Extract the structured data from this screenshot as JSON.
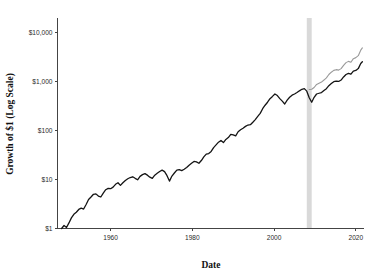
{
  "chart_data": {
    "type": "line",
    "title": "",
    "subtitle": "",
    "xlabel": "Date",
    "ylabel": "Growth of $1 (Log Scale)",
    "yscale": "log",
    "ylim": [
      1,
      20000
    ],
    "xlim": [
      1947,
      2022
    ],
    "grid": false,
    "legend": "none",
    "y_tick_values": [
      1,
      10,
      100,
      1000,
      10000
    ],
    "y_tick_labels": [
      "$1",
      "$10",
      "$100",
      "$1,000",
      "$10,000"
    ],
    "x_tick_values": [
      1960,
      1980,
      2000,
      2020
    ],
    "x_tick_labels": [
      "1960",
      "1980",
      "2000",
      "2020"
    ],
    "annotations": [
      {
        "name": "highlight-band",
        "type": "vertical-band",
        "x_start": 2008.0,
        "x_end": 2009.2,
        "color": "#d9d9d9"
      }
    ],
    "series": [
      {
        "name": "Primary Growth of $1",
        "color": "#141414",
        "linewidth": 1.3,
        "x": [
          1948.0,
          1948.6,
          1949.2,
          1949.8,
          1950.4,
          1951.0,
          1951.6,
          1952.2,
          1952.8,
          1953.4,
          1954.0,
          1954.6,
          1955.2,
          1955.8,
          1956.4,
          1957.0,
          1957.6,
          1958.2,
          1958.8,
          1959.4,
          1960.0,
          1960.6,
          1961.2,
          1961.8,
          1962.4,
          1963.0,
          1963.6,
          1964.2,
          1964.8,
          1965.4,
          1966.0,
          1966.6,
          1967.2,
          1967.8,
          1968.4,
          1969.0,
          1969.6,
          1970.2,
          1970.8,
          1971.4,
          1972.0,
          1972.6,
          1973.2,
          1973.8,
          1974.4,
          1975.0,
          1975.6,
          1976.2,
          1976.8,
          1977.4,
          1978.0,
          1978.6,
          1979.2,
          1979.8,
          1980.4,
          1981.0,
          1981.6,
          1982.2,
          1982.8,
          1983.4,
          1984.0,
          1984.6,
          1985.2,
          1985.8,
          1986.4,
          1987.0,
          1987.6,
          1988.2,
          1988.8,
          1989.4,
          1990.0,
          1990.6,
          1991.2,
          1991.8,
          1992.4,
          1993.0,
          1993.6,
          1994.2,
          1994.8,
          1995.4,
          1996.0,
          1996.6,
          1997.2,
          1997.8,
          1998.4,
          1999.0,
          1999.6,
          2000.2,
          2000.8,
          2001.4,
          2002.0,
          2002.6,
          2003.2,
          2003.8,
          2004.4,
          2005.0,
          2005.6,
          2006.2,
          2006.8,
          2007.4,
          2008.0,
          2008.6,
          2009.2,
          2009.8,
          2010.4,
          2011.0,
          2011.6,
          2012.2,
          2012.8,
          2013.4,
          2014.0,
          2014.6,
          2015.2,
          2015.8,
          2016.4,
          2017.0,
          2017.6,
          2018.2,
          2018.8,
          2019.4,
          2020.0,
          2020.6,
          2021.2,
          2021.6
        ],
        "y": [
          1.0,
          1.15,
          1.05,
          1.3,
          1.65,
          1.95,
          2.15,
          2.45,
          2.6,
          2.5,
          3.1,
          3.9,
          4.4,
          5.0,
          5.1,
          4.6,
          4.4,
          5.3,
          6.2,
          6.6,
          6.5,
          7.0,
          8.0,
          8.6,
          7.6,
          8.6,
          9.6,
          10.4,
          11.0,
          11.4,
          10.6,
          9.9,
          11.6,
          12.6,
          13.2,
          12.3,
          11.2,
          10.6,
          12.3,
          13.4,
          14.6,
          15.6,
          14.5,
          12.0,
          9.3,
          11.8,
          13.6,
          15.6,
          16.0,
          15.2,
          16.2,
          17.6,
          19.6,
          21.5,
          23.5,
          23.0,
          21.5,
          24.5,
          29.0,
          33.0,
          34.0,
          37.5,
          45.0,
          51.0,
          58.0,
          63.0,
          57.0,
          66.0,
          72.0,
          84.0,
          82.0,
          78.0,
          95.0,
          104.0,
          112.0,
          122.0,
          130.0,
          132.0,
          148.0,
          168.0,
          195.0,
          225.0,
          280.0,
          330.0,
          380.0,
          450.0,
          500.0,
          560.0,
          520.0,
          450.0,
          400.0,
          350.0,
          420.0,
          480.0,
          530.0,
          560.0,
          600.0,
          650.0,
          700.0,
          720.0,
          640.0,
          470.0,
          380.0,
          480.0,
          560.0,
          580.0,
          600.0,
          660.0,
          720.0,
          830.0,
          920.0,
          1000.0,
          1030.0,
          1010.0,
          1080.0,
          1250.0,
          1400.0,
          1480.0,
          1420.0,
          1650.0,
          1700.0,
          1850.0,
          2350.0,
          2550.0
        ]
      },
      {
        "name": "Alternate Growth of $1",
        "color": "#9a9a9a",
        "linewidth": 1.1,
        "x": [
          2008.6,
          2009.2,
          2009.8,
          2010.4,
          2011.0,
          2011.6,
          2012.2,
          2012.8,
          2013.4,
          2014.0,
          2014.6,
          2015.2,
          2015.8,
          2016.4,
          2017.0,
          2017.6,
          2018.2,
          2018.8,
          2019.4,
          2020.0,
          2020.6,
          2021.2,
          2021.6
        ],
        "y": [
          690.0,
          700.0,
          760.0,
          880.0,
          930.0,
          980.0,
          1080.0,
          1200.0,
          1400.0,
          1560.0,
          1700.0,
          1760.0,
          1720.0,
          1850.0,
          2150.0,
          2450.0,
          2600.0,
          2500.0,
          2950.0,
          3100.0,
          3400.0,
          4400.0,
          4900.0
        ]
      }
    ]
  }
}
